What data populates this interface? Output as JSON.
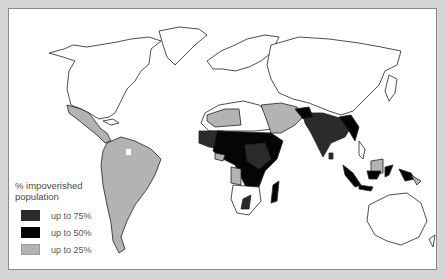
{
  "legend": {
    "title_line1": "% impoverished",
    "title_line2": "population",
    "items": [
      {
        "label": "up to 75%",
        "color": "#2b2b2b"
      },
      {
        "label": "up to 50%",
        "color": "#050505"
      },
      {
        "label": "up to 25%",
        "color": "#b3b3b3"
      }
    ]
  },
  "colors": {
    "background": "#d6d6d6",
    "map_background": "#ffffff",
    "outline": "#222222",
    "level_75": "#2b2b2b",
    "level_50": "#050505",
    "level_25": "#b3b3b3"
  }
}
